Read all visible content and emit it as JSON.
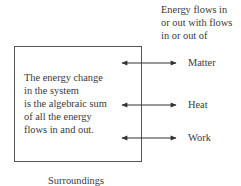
{
  "header": {
    "lines": [
      "Energy flows in",
      "or out with flows",
      "in or out of"
    ]
  },
  "system": {
    "lines": [
      "The energy change",
      "in the system",
      "is the algebraic sum",
      "of all the energy",
      "flows in and out."
    ]
  },
  "flows": [
    {
      "label": "Matter",
      "icon": "double-arrow-icon"
    },
    {
      "label": "Heat",
      "icon": "double-arrow-icon"
    },
    {
      "label": "Work",
      "icon": "double-arrow-icon"
    }
  ],
  "footer": {
    "label": "Surroundings"
  },
  "colors": {
    "line": "#555555",
    "arrow": "#333333",
    "text": "#3a3a3a"
  }
}
